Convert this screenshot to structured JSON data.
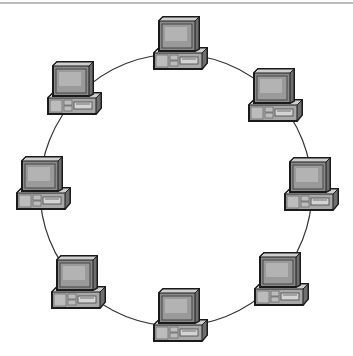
{
  "diagram": {
    "type": "ring-network-topology",
    "ring": {
      "cx": 176,
      "cy": 190,
      "r": 136,
      "stroke": "#333333"
    },
    "colors": {
      "outline": "#1a1a1a",
      "case_light": "#cfcfcf",
      "case_mid": "#a8a8a8",
      "case_dark": "#6e6e6e",
      "screen": "#9a9a9a",
      "screen_glare": "#c4c4c4",
      "top_rule": "#bdbdbd"
    },
    "nodes": [
      {
        "id": "top",
        "icon": "desktop-computer-icon",
        "x": 152,
        "y": 15
      },
      {
        "id": "upper-right",
        "icon": "desktop-computer-icon",
        "x": 247,
        "y": 67
      },
      {
        "id": "right",
        "icon": "desktop-computer-icon",
        "x": 283,
        "y": 156
      },
      {
        "id": "lower-right",
        "icon": "desktop-computer-icon",
        "x": 253,
        "y": 251
      },
      {
        "id": "bottom",
        "icon": "desktop-computer-icon",
        "x": 152,
        "y": 287
      },
      {
        "id": "lower-left",
        "icon": "desktop-computer-icon",
        "x": 50,
        "y": 254
      },
      {
        "id": "left",
        "icon": "desktop-computer-icon",
        "x": 15,
        "y": 155
      },
      {
        "id": "upper-left",
        "icon": "desktop-computer-icon",
        "x": 46,
        "y": 60
      }
    ]
  }
}
